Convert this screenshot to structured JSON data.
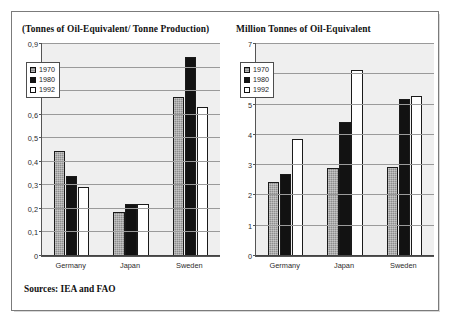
{
  "figure": {
    "source_note": "Sources: IEA and FAO"
  },
  "legend": {
    "entries": [
      {
        "label": "1970",
        "swatch": "gray-swatch",
        "color": "#8e8e8e"
      },
      {
        "label": "1980",
        "swatch": "black-swatch",
        "color": "#121212"
      },
      {
        "label": "1992",
        "swatch": "white-swatch",
        "color": "#ffffff"
      }
    ]
  },
  "chart_data": [
    {
      "type": "bar",
      "panel": "left",
      "title": "(Tonnes of Oil-Equivalent/ Tonne Production)",
      "xlabel": "",
      "ylabel": "",
      "ylim": [
        0,
        0.9
      ],
      "yticks": [
        0,
        0.1,
        0.2,
        0.3,
        0.4,
        0.5,
        0.6,
        0.7,
        0.8,
        0.9
      ],
      "ytick_labels": [
        "0",
        "0,1",
        "0,2",
        "0,3",
        "0,4",
        "0,5",
        "0,6",
        "0,7",
        "0,8",
        "0,9"
      ],
      "grid": true,
      "legend_position": "upper-left",
      "categories": [
        "Germany",
        "Japan",
        "Sweden"
      ],
      "series": [
        {
          "name": "1970",
          "values": [
            0.445,
            0.185,
            0.675
          ]
        },
        {
          "name": "1980",
          "values": [
            0.34,
            0.22,
            0.845
          ]
        },
        {
          "name": "1992",
          "values": [
            0.295,
            0.222,
            0.632
          ]
        }
      ]
    },
    {
      "type": "bar",
      "panel": "right",
      "title": "Million Tonnes of Oil-Equivalent",
      "xlabel": "",
      "ylabel": "",
      "ylim": [
        0,
        7
      ],
      "yticks": [
        0,
        1,
        2,
        3,
        4,
        5,
        6,
        7
      ],
      "ytick_labels": [
        "0",
        "1",
        "2",
        "3",
        "4",
        "5",
        "6",
        "7"
      ],
      "grid": true,
      "legend_position": "upper-left",
      "categories": [
        "Germany",
        "Japan",
        "Sweden"
      ],
      "series": [
        {
          "name": "1970",
          "values": [
            2.45,
            2.92,
            2.95
          ]
        },
        {
          "name": "1980",
          "values": [
            2.7,
            4.42,
            5.2
          ]
        },
        {
          "name": "1992",
          "values": [
            3.85,
            6.15,
            5.3
          ]
        }
      ]
    }
  ]
}
